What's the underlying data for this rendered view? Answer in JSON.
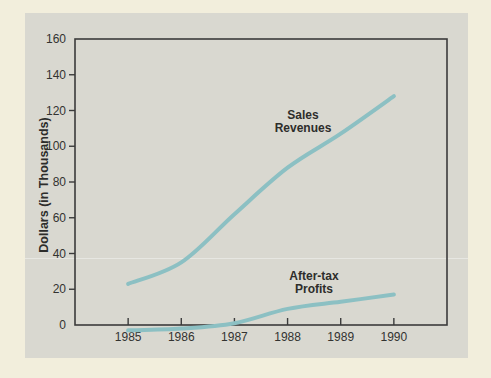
{
  "figure": {
    "background_color": "#f2eedc",
    "panel_color": "#d9d8d0",
    "axis_color": "#3b3b3b",
    "series_line_color": "#8cc0c3",
    "text_color": "#2d2d2b"
  },
  "chart_data": {
    "type": "line",
    "title": "",
    "xlabel": "",
    "ylabel": "Dollars (in Thousands)",
    "categories": [
      "1985",
      "1986",
      "1987",
      "1988",
      "1989",
      "1990"
    ],
    "y_ticks": [
      0,
      20,
      40,
      60,
      80,
      100,
      120,
      140,
      160
    ],
    "ylim": [
      0,
      160
    ],
    "grid": false,
    "legend_position": "inline-annotations",
    "series": [
      {
        "name": "Sales Revenues",
        "values": [
          23,
          35,
          62,
          88,
          107,
          128
        ]
      },
      {
        "name": "After-tax Profits",
        "values": [
          -3,
          -2,
          1,
          9,
          13,
          17
        ]
      }
    ]
  },
  "annotations": {
    "sales": {
      "line1": "Sales",
      "line2": "Revenues"
    },
    "profits": {
      "line1": "After-tax",
      "line2": "Profits"
    }
  }
}
